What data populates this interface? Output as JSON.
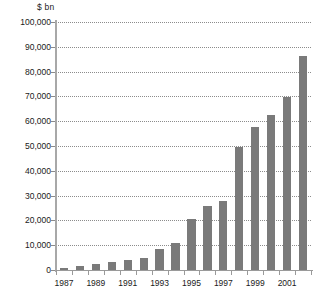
{
  "chart_data": {
    "type": "bar",
    "title": "",
    "subtitle": "",
    "xlabel": "",
    "ylabel": "$ bn",
    "unit_label": "$ bn",
    "grid": true,
    "legend": false,
    "legend_position": "none",
    "bar_color": "#7a7a7a",
    "gridline_color": "#8c8c8c",
    "axis_color": "#9a9a9a",
    "text_color": "#1a1a1a",
    "background_color": "#ffffff",
    "ylim": [
      0,
      100000
    ],
    "ytick_labels": [
      "100,000",
      "90,000",
      "80,000",
      "70,000",
      "60,000",
      "50,000",
      "40,000",
      "30,000",
      "20,000",
      "10,000",
      "0"
    ],
    "ytick_values": [
      100000,
      90000,
      80000,
      70000,
      60000,
      50000,
      40000,
      30000,
      20000,
      10000,
      0
    ],
    "categories": [
      "1987",
      "1988",
      "1989",
      "1990",
      "1991",
      "1992",
      "1993",
      "1994",
      "1995",
      "1996",
      "1997",
      "1998",
      "1999",
      "2000",
      "2001",
      "2002"
    ],
    "xtick_labels_visible": [
      "1987",
      "1989",
      "1991",
      "1993",
      "1995",
      "1997",
      "1999",
      "2001"
    ],
    "values": [
      900,
      1600,
      2300,
      3300,
      4000,
      5000,
      8400,
      11000,
      20500,
      25800,
      27800,
      49800,
      57500,
      62600,
      69800,
      86300
    ]
  }
}
